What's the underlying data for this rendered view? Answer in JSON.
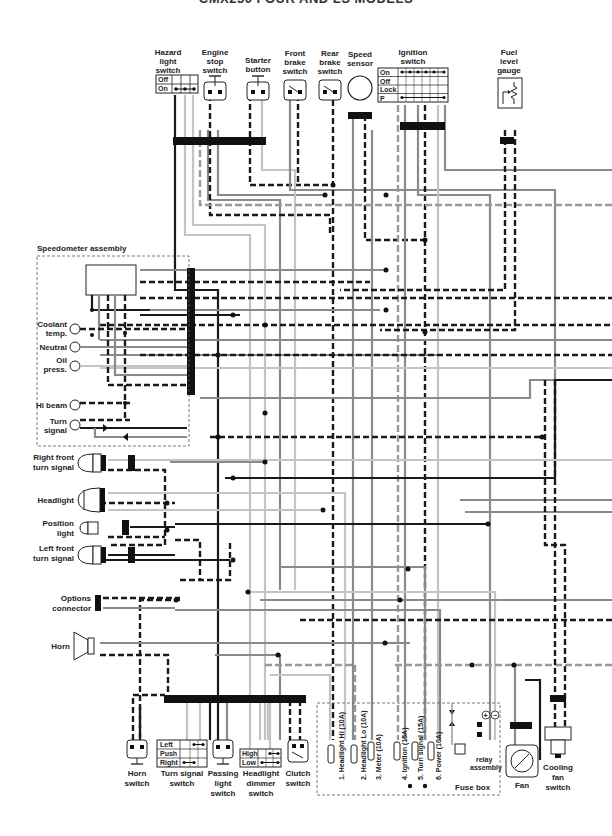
{
  "title": "CMX250 FOUR AND LS MODELS",
  "components_top": [
    {
      "id": "hazard",
      "label": [
        "Hazard",
        "light",
        "switch"
      ],
      "x": 168
    },
    {
      "id": "engine_stop",
      "label": [
        "Engine",
        "stop",
        "switch"
      ],
      "x": 215
    },
    {
      "id": "starter",
      "label": [
        "Starter",
        "button"
      ],
      "x": 258
    },
    {
      "id": "front_brake",
      "label": [
        "Front",
        "brake",
        "switch"
      ],
      "x": 295
    },
    {
      "id": "rear_brake",
      "label": [
        "Rear",
        "brake",
        "switch"
      ],
      "x": 330
    },
    {
      "id": "speed_sensor",
      "label": [
        "Speed",
        "sensor"
      ],
      "x": 360
    },
    {
      "id": "ignition",
      "label": [
        "Ignition",
        "switch"
      ],
      "x": 413
    },
    {
      "id": "fuel_gauge",
      "label": [
        "Fuel",
        "level",
        "gauge"
      ],
      "x": 509
    }
  ],
  "hazard_switch": {
    "rows": [
      "Off",
      "On"
    ]
  },
  "ignition_switch": {
    "rows": [
      "On",
      "Off",
      "Lock",
      "P"
    ]
  },
  "speedometer": {
    "title": "Speedometer assembly",
    "indicators": [
      {
        "label": [
          "Coolant",
          "temp."
        ]
      },
      {
        "label": [
          "Neutral"
        ]
      },
      {
        "label": [
          "Oil",
          "press."
        ]
      },
      {
        "label": [
          "Hi beam"
        ]
      },
      {
        "label": [
          "Turn",
          "signal"
        ]
      }
    ]
  },
  "components_left": [
    {
      "id": "rf_turn",
      "label": [
        "Right front",
        "turn signal"
      ]
    },
    {
      "id": "headlight",
      "label": [
        "Headlight"
      ]
    },
    {
      "id": "position",
      "label": [
        "Position",
        "light"
      ]
    },
    {
      "id": "lf_turn",
      "label": [
        "Left front",
        "turn signal"
      ]
    },
    {
      "id": "options",
      "label": [
        "Options",
        "connector"
      ]
    },
    {
      "id": "horn",
      "label": [
        "Horn"
      ]
    }
  ],
  "components_bottom": [
    {
      "id": "horn_switch",
      "label": [
        "Horn",
        "switch"
      ]
    },
    {
      "id": "turn_switch",
      "label": [
        "Turn signal",
        "switch"
      ],
      "rows": [
        "Left",
        "Push",
        "Right"
      ]
    },
    {
      "id": "passing",
      "label": [
        "Passing",
        "light",
        "switch"
      ]
    },
    {
      "id": "dimmer",
      "label": [
        "Headlight",
        "dimmer",
        "switch"
      ],
      "rows": [
        "High",
        "Low"
      ]
    },
    {
      "id": "clutch",
      "label": [
        "Clutch",
        "switch"
      ]
    }
  ],
  "fuse_box": {
    "title": "Fuse box",
    "fuses": [
      "1. Headlight Hi (10A)",
      "2. Headlight Lo (10A)",
      "3. Meter (10A)",
      "4. Ignition (15A)",
      "5. Turn signal (15A)",
      "6. Power (10A)"
    ],
    "relay_label": [
      "relay",
      "assembly"
    ],
    "terminals": [
      "+",
      "−"
    ]
  },
  "components_right": [
    {
      "id": "fan",
      "label": [
        "Fan"
      ]
    },
    {
      "id": "fan_switch",
      "label": [
        "Cooling",
        "fan",
        "switch"
      ]
    }
  ]
}
